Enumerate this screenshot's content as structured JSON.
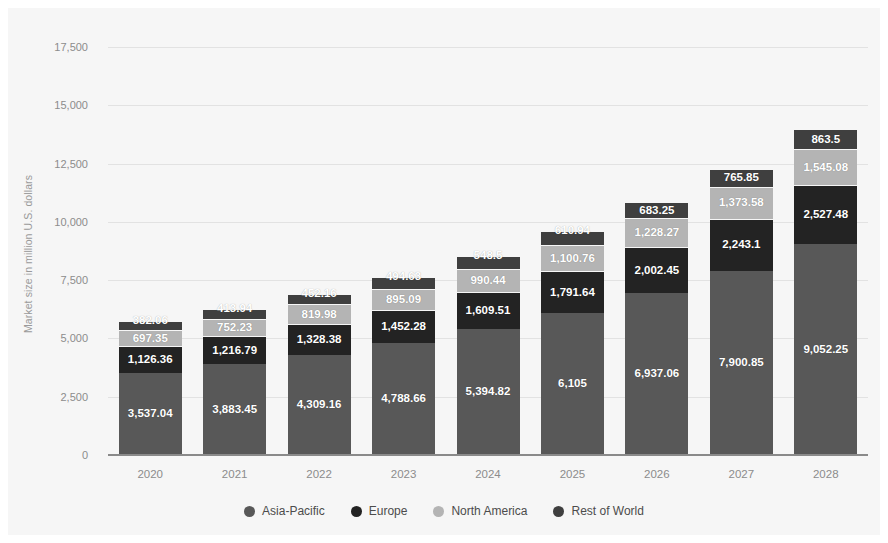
{
  "chart_data": {
    "type": "bar",
    "subtype": "stacked-bar",
    "title": "",
    "xlabel": "",
    "ylabel": "Market size in million U.S. dollars",
    "categories": [
      "2020",
      "2021",
      "2022",
      "2023",
      "2024",
      "2025",
      "2026",
      "2027",
      "2028"
    ],
    "ylim": [
      0,
      17500
    ],
    "yticks": [
      0,
      2500,
      5000,
      7500,
      10000,
      12500,
      15000,
      17500
    ],
    "ytick_labels": [
      "0",
      "2,500",
      "5,000",
      "7,500",
      "10,000",
      "12,500",
      "15,000",
      "17,500"
    ],
    "grid": true,
    "legend_position": "bottom",
    "series": [
      {
        "name": "Asia-Pacific",
        "color": "#585858",
        "values": [
          3537.04,
          3883.45,
          4309.16,
          4788.66,
          5394.82,
          6105,
          6937.06,
          7900.85,
          9052.25
        ],
        "labels": [
          "3,537.04",
          "3,883.45",
          "4,309.16",
          "4,788.66",
          "5,394.82",
          "6,105",
          "6,937.06",
          "7,900.85",
          "9,052.25"
        ]
      },
      {
        "name": "Europe",
        "color": "#232323",
        "values": [
          1126.36,
          1216.79,
          1328.38,
          1452.28,
          1609.51,
          1791.64,
          2002.45,
          2243.1,
          2527.48
        ],
        "labels": [
          "1,126.36",
          "1,216.79",
          "1,328.38",
          "1,452.28",
          "1,609.51",
          "1,791.64",
          "2,002.45",
          "2,243.1",
          "2,527.48"
        ]
      },
      {
        "name": "North America",
        "color": "#b4b4b4",
        "values": [
          697.35,
          752.23,
          819.98,
          895.09,
          990.44,
          1100.76,
          1228.27,
          1373.58,
          1545.08
        ],
        "labels": [
          "697.35",
          "752.23",
          "819.98",
          "895.09",
          "990.44",
          "1,100.76",
          "1,228.27",
          "1,373.58",
          "1,545.08"
        ]
      },
      {
        "name": "Rest of World",
        "color": "#3f3f3f",
        "values": [
          382.06,
          413.94,
          452.16,
          494.63,
          548.5,
          610.94,
          683.25,
          765.85,
          863.5
        ],
        "labels": [
          "382.06",
          "413.94",
          "452.16",
          "494.63",
          "548.5",
          "610.94",
          "683.25",
          "765.85",
          "863.5"
        ]
      }
    ]
  },
  "legend": {
    "items": [
      {
        "label": "Asia-Pacific",
        "color": "#585858"
      },
      {
        "label": "Europe",
        "color": "#232323"
      },
      {
        "label": "North America",
        "color": "#b4b4b4"
      },
      {
        "label": "Rest of World",
        "color": "#3f3f3f"
      }
    ]
  },
  "colors": {
    "background": "#f6f6f6",
    "page": "#ffffff",
    "gridline": "#e2e2e2",
    "axis": "#8a8a8a",
    "tick_text": "#8c8c8c",
    "label_text": "#ffffff",
    "legend_text": "#4c4c4c"
  }
}
